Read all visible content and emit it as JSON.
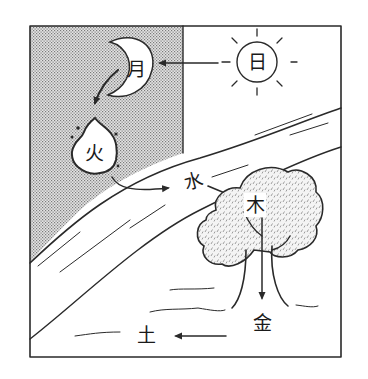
{
  "diagram": {
    "elements": {
      "sun": {
        "label": "日",
        "meaning": "Sun"
      },
      "moon": {
        "label": "月",
        "meaning": "Moon"
      },
      "fire": {
        "label": "火",
        "meaning": "Fire"
      },
      "water": {
        "label": "水",
        "meaning": "Water"
      },
      "wood": {
        "label": "木",
        "meaning": "Wood"
      },
      "metal": {
        "label": "金",
        "meaning": "Metal"
      },
      "earth": {
        "label": "土",
        "meaning": "Earth"
      }
    },
    "flow": [
      "日 → 月",
      "月 → 火",
      "火 → 水",
      "水 → 木",
      "木 → 金",
      "金 → 土"
    ],
    "colors": {
      "ink": "#2a2a2a",
      "shade": "#c8c8c8",
      "background": "#ffffff"
    }
  }
}
